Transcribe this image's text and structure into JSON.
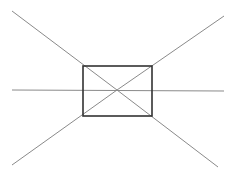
{
  "diagram": {
    "canvas": {
      "width": 234,
      "height": 176,
      "background": "#ffffff"
    },
    "rectangle": {
      "x": 83,
      "y": 66,
      "width": 69,
      "height": 50,
      "stroke": "#333333",
      "stroke_width": 1.6
    },
    "center": {
      "x": 117,
      "y": 90
    },
    "lines": [
      {
        "name": "vanishing-line-upper-left",
        "x1": 12,
        "y1": 11,
        "x2": 117,
        "y2": 90
      },
      {
        "name": "vanishing-line-upper-right",
        "x1": 224,
        "y1": 16,
        "x2": 117,
        "y2": 90
      },
      {
        "name": "vanishing-line-lower-left",
        "x1": 12,
        "y1": 165,
        "x2": 117,
        "y2": 90
      },
      {
        "name": "vanishing-line-lower-right",
        "x1": 218,
        "y1": 167,
        "x2": 117,
        "y2": 90
      },
      {
        "name": "horizon-line",
        "x1": 12,
        "y1": 90,
        "x2": 224,
        "y2": 91
      }
    ],
    "line_color": "#8a8a8a"
  }
}
